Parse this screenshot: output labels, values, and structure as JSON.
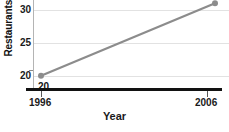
{
  "chart_data": {
    "type": "line",
    "title": "",
    "xlabel": "Year",
    "ylabel": "Restaurants (in th",
    "x": [
      1996,
      2006
    ],
    "categories": [
      "1996",
      "2006"
    ],
    "series": [
      {
        "name": "Restaurants",
        "values": [
          20,
          31
        ],
        "point_labels": [
          "20",
          "31"
        ],
        "color": "#8c8c8c",
        "marker_color": "#8c8c8c"
      }
    ],
    "xlim": [
      1996,
      2006
    ],
    "ylim": [
      18,
      31.5
    ],
    "yticks": [
      20,
      25,
      30
    ],
    "ytick_labels": [
      "20",
      "25",
      "30"
    ],
    "xticks": [
      1996,
      2006
    ],
    "xtick_labels": [
      "1996",
      "2006"
    ],
    "grid": true,
    "grid_color": "#e2e2e2",
    "legend": null,
    "legend_position": "none",
    "axis_color": "#121212",
    "bottom_caption": ""
  }
}
